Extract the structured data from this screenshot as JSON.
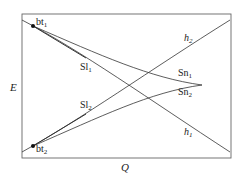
{
  "diagram": {
    "axes": {
      "ylabel": "E",
      "xlabel": "Q"
    },
    "points": [
      {
        "id": "bt1",
        "label": "bt",
        "sub": "1"
      },
      {
        "id": "bt2",
        "label": "bt",
        "sub": "2"
      }
    ],
    "curves": [
      {
        "id": "h1",
        "label": "h",
        "sub": "1"
      },
      {
        "id": "h2",
        "label": "h",
        "sub": "2"
      },
      {
        "id": "Sl1",
        "label": "Sl",
        "sub": "1"
      },
      {
        "id": "Sl2",
        "label": "Sl",
        "sub": "2"
      },
      {
        "id": "Sn1",
        "label": "Sn",
        "sub": "1"
      },
      {
        "id": "Sn2",
        "label": "Sn",
        "sub": "2"
      }
    ],
    "colors": {
      "line": "#333333",
      "frame": "#555555",
      "point": "#111111"
    }
  }
}
